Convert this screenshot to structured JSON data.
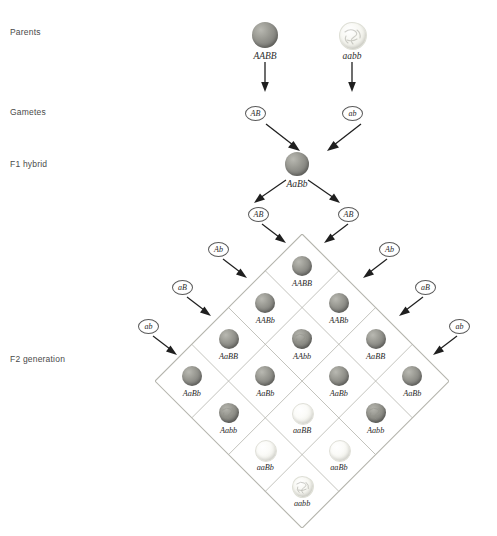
{
  "diagram": {
    "row_labels": [
      {
        "text": "Parents",
        "y": 30
      },
      {
        "text": "Gametes",
        "y": 110
      },
      {
        "text": "F1 hybrid",
        "y": 162
      },
      {
        "text": "F2 generation",
        "y": 357
      }
    ],
    "colors": {
      "smooth_grey": "#8a8a85",
      "smooth_white": "#f3f3ee",
      "wrinkled_grey": "#7f7f79",
      "wrinkled_white": "#efefe8",
      "line": "#b4b4ac",
      "text": "#2e2e2e",
      "label_text": "#4a4a4a",
      "background": "#ffffff"
    },
    "parents": [
      {
        "genotype": "AABB",
        "seed": "smooth-grey",
        "x": 265,
        "y": 22,
        "size": 26
      },
      {
        "genotype": "aabb",
        "seed": "wrinkled-white",
        "x": 352,
        "y": 22,
        "size": 26
      }
    ],
    "parent_gametes": [
      {
        "label": "AB",
        "x": 255,
        "y": 106
      },
      {
        "label": "ab",
        "x": 352,
        "y": 106
      }
    ],
    "f1_hybrid": {
      "genotype": "AaBb",
      "seed": "smooth-grey",
      "x": 297,
      "y": 152,
      "size": 24
    },
    "f1_gametes_top": [
      {
        "label": "AB",
        "x": 258,
        "y": 207
      },
      {
        "label": "AB",
        "x": 348,
        "y": 207
      }
    ],
    "f1_gametes_left": [
      {
        "label": "Ab",
        "x": 218,
        "y": 242
      },
      {
        "label": "aB",
        "x": 182,
        "y": 280
      },
      {
        "label": "ab",
        "x": 148,
        "y": 319
      }
    ],
    "f1_gametes_right": [
      {
        "label": "Ab",
        "x": 389,
        "y": 242
      },
      {
        "label": "aB",
        "x": 425,
        "y": 280
      },
      {
        "label": "ab",
        "x": 459,
        "y": 319
      }
    ],
    "punnett": {
      "orientation": "diamond",
      "rows": 4,
      "cols": 4,
      "cell_size": 52,
      "center_x": 303,
      "top_y": 234,
      "cells": [
        {
          "genotype": "AABB",
          "seed": "smooth-grey",
          "row": 0,
          "col": 0
        },
        {
          "genotype": "AABb",
          "seed": "smooth-grey",
          "row": 0,
          "col": 1
        },
        {
          "genotype": "AaBB",
          "seed": "smooth-grey",
          "row": 0,
          "col": 2
        },
        {
          "genotype": "AaBb",
          "seed": "smooth-grey",
          "row": 0,
          "col": 3
        },
        {
          "genotype": "AABb",
          "seed": "smooth-grey",
          "row": 1,
          "col": 0
        },
        {
          "genotype": "AAbb",
          "seed": "wrinkled-grey",
          "row": 1,
          "col": 1
        },
        {
          "genotype": "AaBb",
          "seed": "smooth-grey",
          "row": 1,
          "col": 2
        },
        {
          "genotype": "Aabb",
          "seed": "wrinkled-grey",
          "row": 1,
          "col": 3
        },
        {
          "genotype": "AaBB",
          "seed": "smooth-grey",
          "row": 2,
          "col": 0
        },
        {
          "genotype": "AaBb",
          "seed": "smooth-grey",
          "row": 2,
          "col": 1
        },
        {
          "genotype": "aaBB",
          "seed": "smooth-white",
          "row": 2,
          "col": 2
        },
        {
          "genotype": "aaBb",
          "seed": "smooth-white",
          "row": 2,
          "col": 3
        },
        {
          "genotype": "AaBb",
          "seed": "smooth-grey",
          "row": 3,
          "col": 0
        },
        {
          "genotype": "Aabb",
          "seed": "wrinkled-grey",
          "row": 3,
          "col": 1
        },
        {
          "genotype": "aaBb",
          "seed": "smooth-white",
          "row": 3,
          "col": 2
        },
        {
          "genotype": "aabb",
          "seed": "wrinkled-white",
          "row": 3,
          "col": 3
        }
      ]
    },
    "footer_note": ""
  }
}
